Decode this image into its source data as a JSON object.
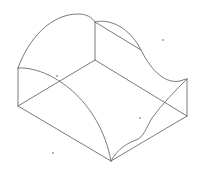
{
  "diagram": {
    "type": "isometric-wireframe-solid",
    "stroke_color": "#6b6b6b",
    "dot_color": "#555555",
    "background": "#ffffff",
    "stroke_width": 0.9,
    "vertices": {
      "left_top": [
        18,
        68
      ],
      "left_bottom": [
        18,
        106
      ],
      "back_top": [
        95,
        22
      ],
      "back_bottom": [
        95,
        60
      ],
      "right_top": [
        187,
        79
      ],
      "right_bottom": [
        187,
        116
      ],
      "front_bottom": [
        111,
        161
      ],
      "s_curve_mid": [
        141,
        50
      ]
    },
    "edges": [
      {
        "id": "left-vertical-edge",
        "d": "M18,68 L18,106"
      },
      {
        "id": "back-vertical-edge",
        "d": "M95,22 L95,60"
      },
      {
        "id": "right-vertical-edge",
        "d": "M187,79 L187,116"
      },
      {
        "id": "base-left-back-edge",
        "d": "M18,106 L95,60"
      },
      {
        "id": "base-back-right-edge",
        "d": "M95,60 L187,116"
      },
      {
        "id": "base-left-front-edge",
        "d": "M18,106 L111,161"
      },
      {
        "id": "base-front-right-edge",
        "d": "M111,161 L187,116"
      },
      {
        "id": "top-back-arc",
        "d": "M18,68 C28,40 50,14 78,14 C86,14 92,17 95,22"
      },
      {
        "id": "front-arc",
        "d": "M18,68 C50,66 100,100 111,161"
      },
      {
        "id": "top-right-s-curve",
        "d": "M95,22 C110,18 130,28 141,50 C152,72 166,84 180,81 C183,80 185,79 187,79"
      },
      {
        "id": "top-right-diagonal",
        "d": "M95,22 L141,50"
      },
      {
        "id": "front-right-s-curve",
        "d": "M111,161 C118,148 128,143 136,140 C144,137 146,128 152,118 C162,104 176,90 187,79"
      }
    ],
    "dots": [
      {
        "id": "stray-dot-1",
        "cx": 163,
        "cy": 40
      },
      {
        "id": "stray-dot-2",
        "cx": 140,
        "cy": 118
      },
      {
        "id": "stray-dot-3",
        "cx": 53,
        "cy": 153
      },
      {
        "id": "stray-dot-4",
        "cx": 57,
        "cy": 76
      }
    ]
  }
}
